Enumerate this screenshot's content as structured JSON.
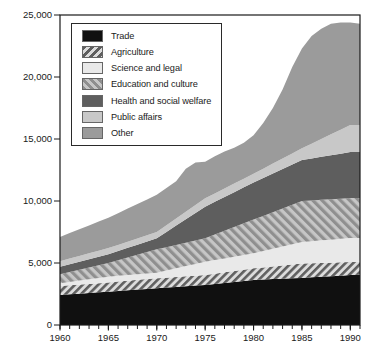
{
  "axes": {
    "y": {
      "min": 0,
      "max": 25000,
      "ticks": [
        {
          "v": 0,
          "label": "0"
        },
        {
          "v": 5000,
          "label": "5,000"
        },
        {
          "v": 10000,
          "label": "10,000"
        },
        {
          "v": 15000,
          "label": "15,000"
        },
        {
          "v": 20000,
          "label": "20,000"
        },
        {
          "v": 25000,
          "label": "25,000"
        }
      ]
    },
    "x": {
      "min": 1960,
      "max": 1991,
      "minor_step": 1,
      "ticks": [
        {
          "v": 1960,
          "label": "1960"
        },
        {
          "v": 1965,
          "label": "1965"
        },
        {
          "v": 1970,
          "label": "1970"
        },
        {
          "v": 1975,
          "label": "1975"
        },
        {
          "v": 1980,
          "label": "1980"
        },
        {
          "v": 1985,
          "label": "1985"
        },
        {
          "v": 1990,
          "label": "1990"
        }
      ]
    }
  },
  "legend": {
    "items": [
      {
        "id": "trade",
        "label": "Trade"
      },
      {
        "id": "agriculture",
        "label": "Agriculture"
      },
      {
        "id": "science-and-legal",
        "label": "Science and legal"
      },
      {
        "id": "education-and-culture",
        "label": "Education and culture"
      },
      {
        "id": "health-and-social-welfare",
        "label": "Health and social welfare"
      },
      {
        "id": "public-affairs",
        "label": "Public affairs"
      },
      {
        "id": "other",
        "label": "Other"
      }
    ]
  },
  "chart_data": {
    "type": "area",
    "stacked": true,
    "title": "",
    "xlabel": "",
    "ylabel": "",
    "grid": false,
    "legend_position": "upper-left",
    "xlim": [
      1960,
      1991
    ],
    "ylim": [
      0,
      25000
    ],
    "x": [
      1960,
      1961,
      1962,
      1963,
      1964,
      1965,
      1966,
      1967,
      1968,
      1969,
      1970,
      1971,
      1972,
      1973,
      1974,
      1975,
      1976,
      1977,
      1978,
      1979,
      1980,
      1981,
      1982,
      1983,
      1984,
      1985,
      1986,
      1987,
      1988,
      1989,
      1990,
      1991
    ],
    "series": [
      {
        "id": "trade",
        "name": "Trade",
        "fill": {
          "type": "solid",
          "color": "#101010"
        },
        "values": [
          2420,
          2475,
          2530,
          2585,
          2640,
          2690,
          2745,
          2800,
          2855,
          2910,
          2960,
          3015,
          3070,
          3125,
          3180,
          3230,
          3310,
          3390,
          3470,
          3550,
          3630,
          3665,
          3700,
          3735,
          3770,
          3800,
          3845,
          3890,
          3935,
          3980,
          4030,
          4050
        ]
      },
      {
        "id": "agriculture",
        "name": "Agriculture",
        "fill": {
          "type": "hatch",
          "direction": "forward",
          "stripe": "#5f5f5f",
          "bg": "#dcdcdc"
        },
        "values": [
          730,
          730,
          730,
          730,
          730,
          740,
          755,
          770,
          785,
          795,
          810,
          805,
          805,
          800,
          800,
          800,
          830,
          860,
          885,
          915,
          940,
          980,
          1020,
          1065,
          1105,
          1150,
          1130,
          1110,
          1095,
          1075,
          1050,
          1050
        ]
      },
      {
        "id": "science-and-legal",
        "name": "Science and legal",
        "fill": {
          "type": "solid",
          "color": "#e9e9e9"
        },
        "values": [
          210,
          265,
          320,
          375,
          430,
          470,
          465,
          460,
          455,
          455,
          450,
          580,
          700,
          825,
          945,
          1070,
          1095,
          1120,
          1155,
          1180,
          1210,
          1320,
          1430,
          1530,
          1640,
          1750,
          1785,
          1825,
          1855,
          1895,
          1930,
          1910
        ]
      },
      {
        "id": "education-and-culture",
        "name": "Education and culture",
        "fill": {
          "type": "hatch",
          "direction": "backward",
          "stripe": "#8f8f8f",
          "bg": "#c6c6c6"
        },
        "values": [
          740,
          810,
          880,
          950,
          1020,
          1100,
          1255,
          1410,
          1565,
          1720,
          1880,
          1880,
          1885,
          1890,
          1895,
          1900,
          2065,
          2230,
          2390,
          2555,
          2720,
          2835,
          2950,
          3070,
          3185,
          3300,
          3290,
          3275,
          3265,
          3240,
          3230,
          3230
        ]
      },
      {
        "id": "health-and-social-welfare",
        "name": "Health and social welfare",
        "fill": {
          "type": "solid",
          "color": "#5e5e5e"
        },
        "values": [
          600,
          620,
          640,
          660,
          680,
          700,
          740,
          780,
          820,
          860,
          900,
          1230,
          1560,
          1890,
          2220,
          2540,
          2630,
          2720,
          2810,
          2910,
          3000,
          3060,
          3120,
          3180,
          3240,
          3300,
          3380,
          3460,
          3540,
          3630,
          3710,
          3710
        ]
      },
      {
        "id": "public-affairs",
        "name": "Public affairs",
        "fill": {
          "type": "solid",
          "color": "#c8c8c8"
        },
        "values": [
          450,
          460,
          470,
          480,
          490,
          500,
          500,
          500,
          500,
          500,
          500,
          530,
          570,
          600,
          640,
          675,
          680,
          690,
          700,
          690,
          700,
          750,
          800,
          850,
          900,
          950,
          1190,
          1440,
          1690,
          1930,
          2180,
          2180
        ]
      },
      {
        "id": "other",
        "name": "Other",
        "fill": {
          "type": "solid",
          "color": "#9b9b9b"
        },
        "values": [
          1950,
          2050,
          2150,
          2250,
          2350,
          2450,
          2560,
          2670,
          2780,
          2890,
          3000,
          3010,
          3010,
          3470,
          3420,
          2955,
          2990,
          2990,
          2890,
          2900,
          3100,
          3690,
          4480,
          5570,
          6960,
          8050,
          8680,
          8900,
          8920,
          8650,
          8270,
          8170
        ]
      }
    ]
  }
}
